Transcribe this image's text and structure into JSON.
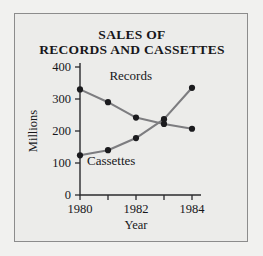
{
  "figure": {
    "border_color": "#8c8c8c",
    "panel_bg": "#ececea",
    "page_bg": "#f1f1ef"
  },
  "chart_data": {
    "type": "line",
    "title": "SALES OF RECORDS AND CASSETTES",
    "title_line1": "SALES OF",
    "title_line2": "RECORDS AND CASSETTES",
    "xlabel": "Year",
    "ylabel": "Millions",
    "x": [
      1980,
      1981,
      1982,
      1983,
      1984
    ],
    "xtick_values": [
      1980,
      1981,
      1982,
      1983,
      1984
    ],
    "xtick_labels": [
      "1980",
      "",
      "1982",
      "",
      "1984"
    ],
    "xlim": [
      1980,
      1984
    ],
    "ytick_values": [
      0,
      100,
      200,
      300,
      400
    ],
    "ytick_labels": [
      "0",
      "100",
      "200",
      "300",
      "400"
    ],
    "ylim": [
      0,
      400
    ],
    "grid": false,
    "legend": "inline-labels",
    "line_color": "#7d7d80",
    "marker_color": "#1b1b1e",
    "series": [
      {
        "name": "Records",
        "label": "Records",
        "label_x": 1981.05,
        "label_y": 360,
        "values": [
          330,
          290,
          242,
          222,
          207
        ]
      },
      {
        "name": "Cassettes",
        "label": "Cassettes",
        "label_x": 1980.25,
        "label_y": 95,
        "values": [
          124,
          140,
          178,
          237,
          335
        ]
      }
    ]
  }
}
